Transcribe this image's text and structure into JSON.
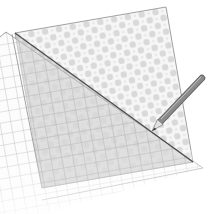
{
  "illustration": {
    "title": "Folded patterned paper with grid sheet and pencil",
    "colors": {
      "background": "#ffffff",
      "paper_fill": "#f4f4f4",
      "pattern_blob": "#d6d6d6",
      "grid_line": "#b4b4b4",
      "fold_shade": "#c8c8c8",
      "edge_line": "#7a7a7a",
      "fold_line": "#4a4a4a",
      "pencil_body": "#8c8c8c",
      "pencil_tip": "#3a3a3a"
    },
    "elements": [
      {
        "name": "patterned-sheet",
        "shape": "square"
      },
      {
        "name": "grid-sheet",
        "shape": "square"
      },
      {
        "name": "folded-triangle",
        "shape": "triangle"
      },
      {
        "name": "pencil",
        "shape": "pencil"
      }
    ]
  }
}
